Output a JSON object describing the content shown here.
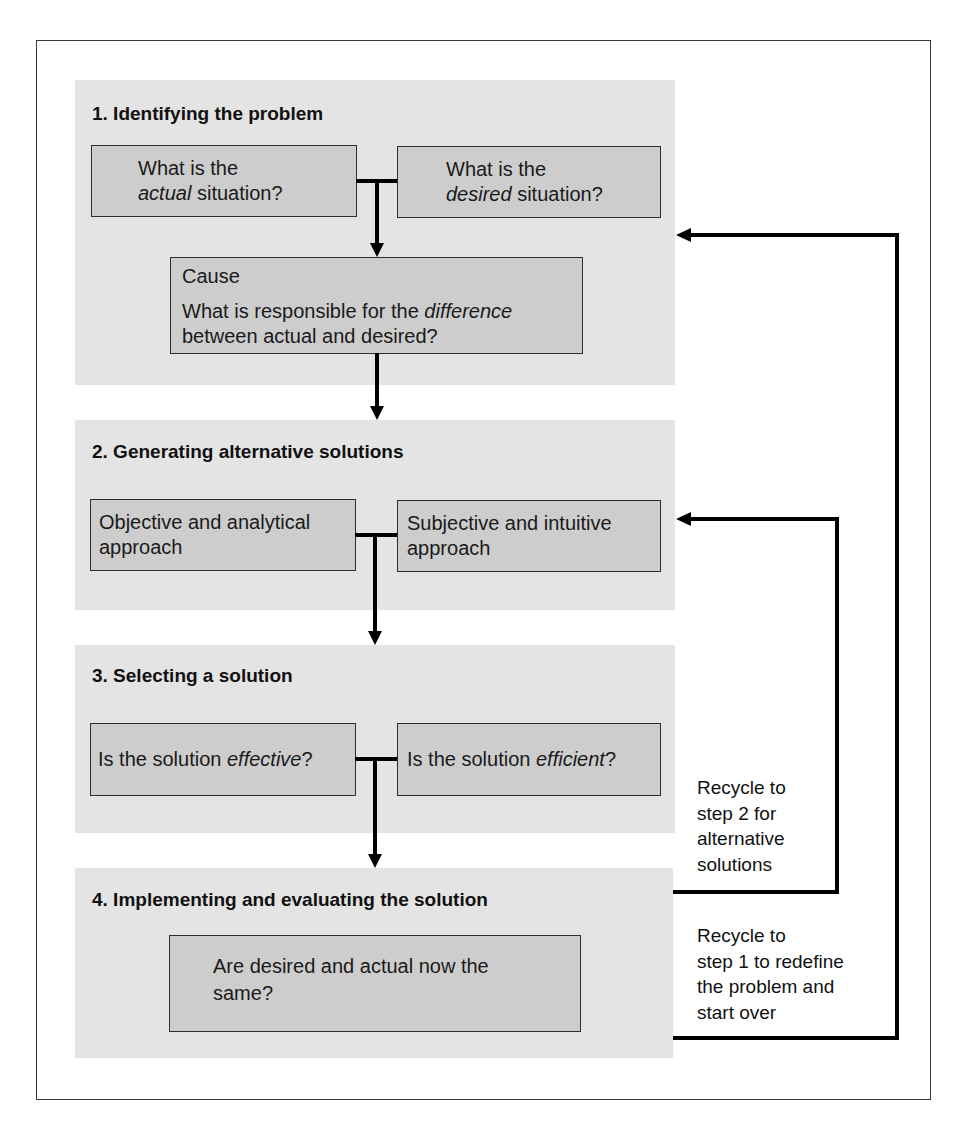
{
  "sections": [
    {
      "heading": "1. Identifying the problem",
      "box_actual": {
        "line1": "What is the",
        "em": "actual",
        "rest": " situation?"
      },
      "box_desired": {
        "line1": "What is the",
        "em": "desired",
        "rest": " situation?"
      },
      "box_cause": {
        "title": "Cause",
        "line1_pre": "What is responsible for the ",
        "line1_em": "difference",
        "line2": "between actual and desired?"
      }
    },
    {
      "heading": "2. Generating alternative solutions",
      "box_objective": {
        "line1": "Objective and analytical",
        "line2": "approach"
      },
      "box_subjective": {
        "line1": "Subjective and intuitive",
        "line2": "approach"
      }
    },
    {
      "heading": "3. Selecting a solution",
      "box_effective": {
        "pre": "Is the solution ",
        "em": "effective",
        "post": "?"
      },
      "box_efficient": {
        "pre": "Is the solution ",
        "em": "efficient",
        "post": "?"
      }
    },
    {
      "heading": "4. Implementing and evaluating the solution",
      "box_same": {
        "line1": "Are desired and actual now the",
        "line2": "same?"
      }
    }
  ],
  "recycle": {
    "to_step2": {
      "lines": [
        "Recycle to",
        "step 2 for",
        "alternative",
        "solutions"
      ]
    },
    "to_step1": {
      "lines": [
        "Recycle to",
        "step 1 to redefine",
        "the problem and",
        "start over"
      ]
    }
  },
  "colors": {
    "panel_bg": "#e4e4e4",
    "box_fill": "#cdcdcd",
    "line": "#000000"
  }
}
